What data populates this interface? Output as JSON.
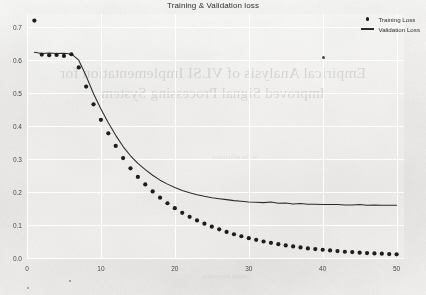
{
  "figure": {
    "title": "Training & Validation loss",
    "background_color": "#f0efed",
    "ink_color": "#2b2b2b"
  },
  "legend": {
    "position": "top-right",
    "entries": [
      {
        "label": "Training Loss",
        "marker": "dot",
        "color": "#1d1d1d"
      },
      {
        "label": "Validation Loss",
        "marker": "line",
        "color": "#2b2b2b"
      }
    ]
  },
  "scan_artifacts": {
    "bleed_through_line1": "Empirical Analysis of VLSI Implementation for",
    "bleed_through_line2": "Improved Signal Processing System",
    "ghost_text_mid": "of the efficiency",
    "ghost_text_bottom": "signal processing"
  },
  "axes": {
    "y_ticks": [
      "0.0",
      "0.1",
      "0.2",
      "0.3",
      "0.4",
      "0.5",
      "0.6",
      "0.7"
    ],
    "x_ticks": [
      "0",
      "10",
      "20",
      "30",
      "40",
      "50"
    ]
  },
  "chart_data": {
    "type": "line",
    "title": "Training & Validation loss",
    "xlabel": "",
    "ylabel": "",
    "xlim": [
      0,
      51
    ],
    "ylim": [
      0.0,
      0.74
    ],
    "grid": true,
    "legend_position": "upper right",
    "x_ticks": [
      0,
      10,
      20,
      30,
      40,
      50
    ],
    "y_ticks": [
      0.0,
      0.1,
      0.2,
      0.3,
      0.4,
      0.5,
      0.6,
      0.7
    ],
    "x": [
      1,
      2,
      3,
      4,
      5,
      6,
      7,
      8,
      9,
      10,
      11,
      12,
      13,
      14,
      15,
      16,
      17,
      18,
      19,
      20,
      21,
      22,
      23,
      24,
      25,
      26,
      27,
      28,
      29,
      30,
      31,
      32,
      33,
      34,
      35,
      36,
      37,
      38,
      39,
      40,
      41,
      42,
      43,
      44,
      45,
      46,
      47,
      48,
      49,
      50
    ],
    "series": [
      {
        "name": "Training Loss",
        "style": "scatter",
        "marker": "dot",
        "color": "#1d1d1d",
        "values": [
          0.72,
          0.617,
          0.615,
          0.616,
          0.613,
          0.618,
          0.578,
          0.52,
          0.466,
          0.419,
          0.378,
          0.34,
          0.303,
          0.272,
          0.246,
          0.223,
          0.202,
          0.183,
          0.166,
          0.151,
          0.137,
          0.125,
          0.114,
          0.104,
          0.095,
          0.087,
          0.079,
          0.072,
          0.066,
          0.06,
          0.055,
          0.05,
          0.046,
          0.042,
          0.038,
          0.035,
          0.032,
          0.029,
          0.027,
          0.025,
          0.023,
          0.021,
          0.019,
          0.018,
          0.016,
          0.015,
          0.014,
          0.013,
          0.012,
          0.011
        ]
      },
      {
        "name": "Validation Loss",
        "style": "line",
        "marker": "none",
        "color": "#2b2b2b",
        "values": [
          0.624,
          0.62,
          0.622,
          0.62,
          0.621,
          0.619,
          0.6,
          0.552,
          0.498,
          0.452,
          0.41,
          0.372,
          0.338,
          0.31,
          0.287,
          0.268,
          0.251,
          0.236,
          0.224,
          0.214,
          0.205,
          0.198,
          0.192,
          0.187,
          0.183,
          0.18,
          0.177,
          0.174,
          0.172,
          0.17,
          0.169,
          0.168,
          0.17,
          0.166,
          0.167,
          0.164,
          0.165,
          0.163,
          0.163,
          0.162,
          0.162,
          0.162,
          0.161,
          0.161,
          0.162,
          0.16,
          0.161,
          0.16,
          0.16,
          0.16
        ]
      }
    ]
  }
}
